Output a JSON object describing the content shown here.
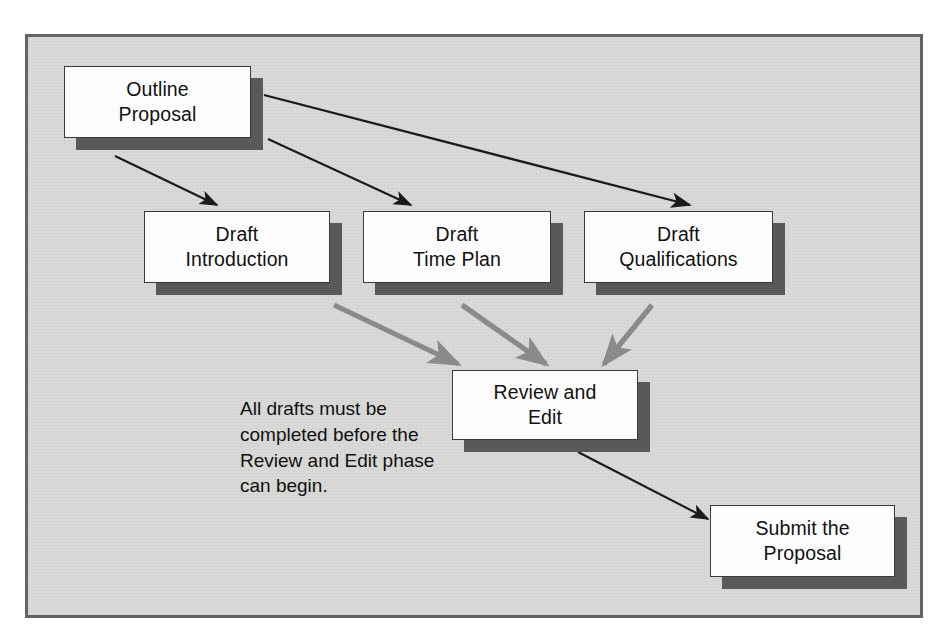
{
  "diagram": {
    "background_color": "#d9d9d7",
    "frame_border_color": "#636363",
    "box_fill_color": "#fdfdfd",
    "box_border_color": "#3a3a3a",
    "box_shadow_color": "#595959",
    "black_arrow_color": "#1a1a1a",
    "gray_arrow_color": "#8a8a8a",
    "nodes": [
      {
        "id": "outline-proposal",
        "label": "Outline\nProposal"
      },
      {
        "id": "draft-introduction",
        "label": "Draft\nIntroduction"
      },
      {
        "id": "draft-time-plan",
        "label": "Draft\nTime Plan"
      },
      {
        "id": "draft-qualifications",
        "label": "Draft\nQualifications"
      },
      {
        "id": "review-and-edit",
        "label": "Review and\nEdit"
      },
      {
        "id": "submit-the-proposal",
        "label": "Submit the\nProposal"
      }
    ],
    "note": "All drafts must be\ncompleted before the\nReview and Edit phase\ncan begin.",
    "connections": [
      {
        "from": "outline-proposal",
        "to": "draft-introduction",
        "style": "black-thin"
      },
      {
        "from": "outline-proposal",
        "to": "draft-time-plan",
        "style": "black-thin"
      },
      {
        "from": "outline-proposal",
        "to": "draft-qualifications",
        "style": "black-thin"
      },
      {
        "from": "draft-introduction",
        "to": "review-and-edit",
        "style": "gray-thick"
      },
      {
        "from": "draft-time-plan",
        "to": "review-and-edit",
        "style": "gray-thick"
      },
      {
        "from": "draft-qualifications",
        "to": "review-and-edit",
        "style": "gray-thick"
      },
      {
        "from": "review-and-edit",
        "to": "submit-the-proposal",
        "style": "black-thin"
      }
    ]
  }
}
